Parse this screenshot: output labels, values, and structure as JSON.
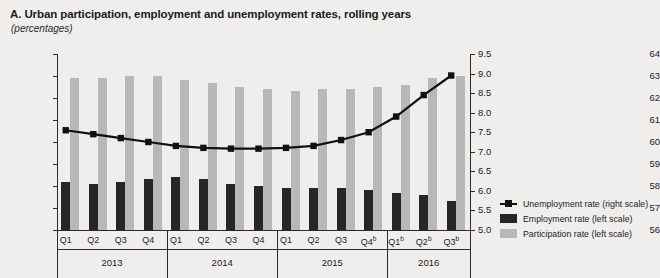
{
  "chart_data": {
    "type": "bar",
    "title": "A. Urban participation, employment and unemployment rates, rolling years",
    "subtitle": "(percentages)",
    "xlabel": "",
    "ylabel": "",
    "grid": false,
    "legend_position": "right",
    "categories": [
      "Q1",
      "Q2",
      "Q3",
      "Q4",
      "Q1",
      "Q2",
      "Q3",
      "Q4",
      "Q1",
      "Q2",
      "Q3",
      "Q4ᵇ",
      "Q1ᵇ",
      "Q2ᵇ",
      "Q3ᵇ"
    ],
    "category_labels": [
      {
        "label": "Q1",
        "sup": ""
      },
      {
        "label": "Q2",
        "sup": ""
      },
      {
        "label": "Q3",
        "sup": ""
      },
      {
        "label": "Q4",
        "sup": ""
      },
      {
        "label": "Q1",
        "sup": ""
      },
      {
        "label": "Q2",
        "sup": ""
      },
      {
        "label": "Q3",
        "sup": ""
      },
      {
        "label": "Q4",
        "sup": ""
      },
      {
        "label": "Q1",
        "sup": ""
      },
      {
        "label": "Q2",
        "sup": ""
      },
      {
        "label": "Q3",
        "sup": ""
      },
      {
        "label": "Q4",
        "sup": "b"
      },
      {
        "label": "Q1",
        "sup": "b"
      },
      {
        "label": "Q2",
        "sup": "b"
      },
      {
        "label": "Q3",
        "sup": "b"
      }
    ],
    "groups": [
      {
        "year": "2013",
        "count": 4
      },
      {
        "year": "2014",
        "count": 4
      },
      {
        "year": "2015",
        "count": 4
      },
      {
        "year": "2016",
        "count": 3
      }
    ],
    "left_axis": {
      "label": "",
      "ylim": [
        56,
        64
      ],
      "ticks": [
        56,
        57,
        58,
        59,
        60,
        61,
        62,
        63,
        64
      ],
      "tick_labels": [
        "56",
        "57",
        "58",
        "59",
        "60",
        "61",
        "62",
        "63",
        "64"
      ]
    },
    "right_axis": {
      "label": "",
      "ylim": [
        5.0,
        9.5
      ],
      "ticks": [
        5.0,
        5.5,
        6.0,
        6.5,
        7.0,
        7.5,
        8.0,
        8.5,
        9.0,
        9.5
      ],
      "tick_labels": [
        "5.0",
        "5.5",
        "6.0",
        "6.5",
        "7.0",
        "7.5",
        "8.0",
        "8.5",
        "9.0",
        "9.5"
      ]
    },
    "series": [
      {
        "name": "Participation rate (left scale)",
        "type": "bar",
        "axis": "left",
        "color": "#b8b8b8",
        "values": [
          62.9,
          62.9,
          63.0,
          63.0,
          62.8,
          62.7,
          62.5,
          62.4,
          62.3,
          62.4,
          62.4,
          62.5,
          62.6,
          62.9,
          63.0
        ]
      },
      {
        "name": "Employment rate (left scale)",
        "type": "bar",
        "axis": "left",
        "color": "#262626",
        "values": [
          58.2,
          58.1,
          58.2,
          58.3,
          58.4,
          58.3,
          58.1,
          58.0,
          57.9,
          57.9,
          57.9,
          57.8,
          57.7,
          57.6,
          57.3
        ]
      },
      {
        "name": "Unemployment rate (right scale)",
        "type": "line",
        "axis": "right",
        "color": "#111111",
        "values": [
          7.55,
          7.45,
          7.35,
          7.25,
          7.15,
          7.1,
          7.08,
          7.08,
          7.1,
          7.15,
          7.3,
          7.5,
          7.9,
          8.45,
          8.95
        ]
      }
    ]
  },
  "legend": {
    "items": [
      {
        "label": "Unemployment rate (right scale)",
        "key": "line",
        "color": "#111111"
      },
      {
        "label": "Employment rate (left scale)",
        "key": "sw-emp",
        "color": "#262626"
      },
      {
        "label": "Participation rate (left scale)",
        "key": "sw-part",
        "color": "#b8b8b8"
      }
    ]
  },
  "colors": {
    "background": "#efeeec",
    "axis": "#2b2b2b",
    "participation": "#b8b8b8",
    "employment": "#262626",
    "unemployment": "#111111"
  }
}
